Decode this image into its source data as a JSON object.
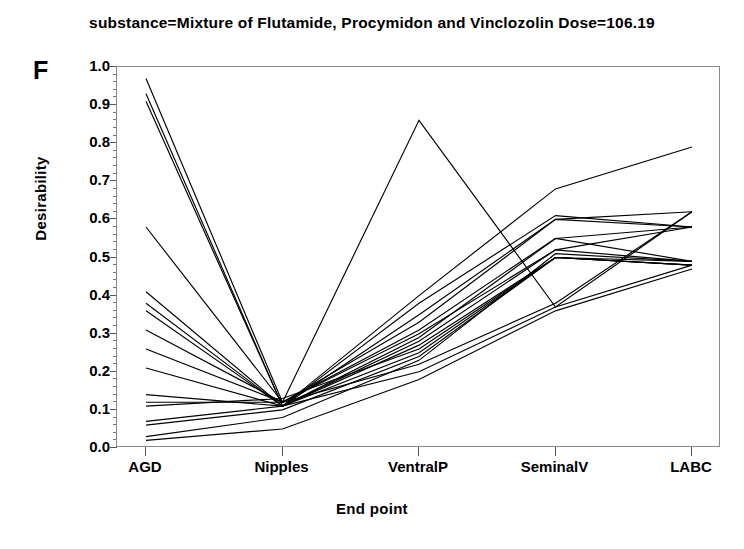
{
  "chart_data": {
    "type": "line",
    "title": "substance=Mixture of Flutamide, Procymidon and Vinclozolin Dose=106.19",
    "panel_label": "F",
    "xlabel": "End point",
    "ylabel": "Desirability",
    "categories": [
      "AGD",
      "Nipples",
      "VentralP",
      "SeminalV",
      "LABC"
    ],
    "ylim": [
      0.0,
      1.0
    ],
    "ytick_labels": [
      "0.0",
      "0.1",
      "0.2",
      "0.3",
      "0.4",
      "0.5",
      "0.6",
      "0.7",
      "0.8",
      "0.9",
      "1.0"
    ],
    "ytick_values": [
      0.0,
      0.1,
      0.2,
      0.3,
      0.4,
      0.5,
      0.6,
      0.7,
      0.8,
      0.9,
      1.0
    ],
    "yminor_step": 0.02,
    "grid": false,
    "legend": "none",
    "line_color": "#000000",
    "series": [
      {
        "name": "profile-01",
        "values": [
          0.97,
          0.12,
          0.3,
          0.52,
          0.49
        ]
      },
      {
        "name": "profile-02",
        "values": [
          0.93,
          0.11,
          0.27,
          0.5,
          0.48
        ]
      },
      {
        "name": "profile-03",
        "values": [
          0.91,
          0.11,
          0.25,
          0.5,
          0.48
        ]
      },
      {
        "name": "profile-04",
        "values": [
          0.58,
          0.12,
          0.86,
          0.37,
          0.62
        ]
      },
      {
        "name": "profile-05",
        "values": [
          0.41,
          0.11,
          0.4,
          0.68,
          0.79
        ]
      },
      {
        "name": "profile-06",
        "values": [
          0.38,
          0.11,
          0.38,
          0.61,
          0.58
        ]
      },
      {
        "name": "profile-07",
        "values": [
          0.36,
          0.11,
          0.35,
          0.6,
          0.58
        ]
      },
      {
        "name": "profile-08",
        "values": [
          0.31,
          0.12,
          0.31,
          0.55,
          0.49
        ]
      },
      {
        "name": "profile-09",
        "values": [
          0.26,
          0.12,
          0.22,
          0.38,
          0.62
        ]
      },
      {
        "name": "profile-10",
        "values": [
          0.21,
          0.11,
          0.2,
          0.37,
          0.48
        ]
      },
      {
        "name": "profile-11",
        "values": [
          0.14,
          0.11,
          0.28,
          0.52,
          0.58
        ]
      },
      {
        "name": "profile-12",
        "values": [
          0.12,
          0.12,
          0.33,
          0.6,
          0.62
        ]
      },
      {
        "name": "profile-13",
        "values": [
          0.11,
          0.13,
          0.26,
          0.5,
          0.49
        ]
      },
      {
        "name": "profile-14",
        "values": [
          0.07,
          0.11,
          0.29,
          0.55,
          0.58
        ]
      },
      {
        "name": "profile-15",
        "values": [
          0.06,
          0.1,
          0.24,
          0.5,
          0.48
        ]
      },
      {
        "name": "profile-16",
        "values": [
          0.03,
          0.08,
          0.23,
          0.51,
          0.49
        ]
      },
      {
        "name": "profile-17",
        "values": [
          0.02,
          0.05,
          0.18,
          0.36,
          0.47
        ]
      }
    ]
  }
}
